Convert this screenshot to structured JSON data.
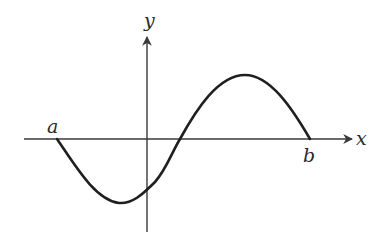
{
  "diagram": {
    "type": "function-graph",
    "axes": {
      "x_label": "x",
      "y_label": "y"
    },
    "points": {
      "left_endpoint_label": "a",
      "right_endpoint_label": "b"
    },
    "colors": {
      "axis": "#3a3a3a",
      "curve": "#1f1f1f",
      "labels": "#2a2a2a",
      "background": "#ffffff"
    }
  }
}
